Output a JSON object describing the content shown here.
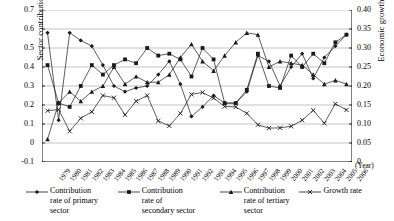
{
  "chart_data": {
    "type": "line",
    "title": "",
    "xlabel": "(Year)",
    "ylabel": "Sector contribution rate",
    "ylabel_right": "Economic growth rate",
    "ylim": [
      -0.1,
      0.7
    ],
    "ylim_right": [
      0,
      0.4
    ],
    "yticks": [
      "0.7",
      "0.6",
      "0.5",
      "0.4",
      "0.3",
      "0.2",
      "0.1",
      "0",
      "-0.1"
    ],
    "yticks_right": [
      "0.40",
      "0.35",
      "0.30",
      "0.25",
      "0.20",
      "0.15",
      "0.10",
      "0.05",
      "0"
    ],
    "grid": true,
    "legend_position": "bottom",
    "categories": [
      "1979",
      "1980",
      "1981",
      "1982",
      "1983",
      "1984",
      "1985",
      "1986",
      "1987",
      "1988",
      "1989",
      "1990",
      "1991",
      "1992",
      "1993",
      "1994",
      "1995",
      "1996",
      "1997",
      "1998",
      "1999",
      "2000",
      "2001",
      "2002",
      "2003",
      "2004",
      "2005",
      "2006"
    ],
    "series": [
      {
        "name": "Contribution rate of primary sector",
        "marker": "diamond",
        "axis": "left",
        "values": [
          0.58,
          0.12,
          0.58,
          0.54,
          0.51,
          0.41,
          0.3,
          0.27,
          0.29,
          0.3,
          0.36,
          0.43,
          0.31,
          0.14,
          0.19,
          0.25,
          0.21,
          0.21,
          0.27,
          0.46,
          0.43,
          0.3,
          0.4,
          0.47,
          0.34,
          0.45,
          0.51,
          0.57
        ]
      },
      {
        "name": "Contribution rate of secondary sector",
        "marker": "square",
        "axis": "left",
        "values": [
          0.41,
          0.21,
          0.19,
          0.3,
          0.41,
          0.36,
          0.41,
          0.44,
          0.42,
          0.5,
          0.46,
          0.47,
          0.44,
          0.35,
          0.5,
          0.44,
          0.21,
          0.21,
          0.28,
          0.47,
          0.3,
          0.29,
          0.46,
          0.4,
          0.47,
          0.42,
          0.53,
          0.57
        ]
      },
      {
        "name": "Contribution rate of tertiary sector",
        "marker": "triangle",
        "axis": "left",
        "values": [
          0.02,
          0.21,
          0.27,
          0.22,
          0.27,
          0.3,
          0.4,
          0.31,
          0.35,
          0.32,
          0.32,
          0.36,
          0.45,
          0.52,
          0.43,
          0.38,
          0.46,
          0.53,
          0.58,
          0.57,
          0.4,
          0.43,
          0.42,
          0.41,
          0.36,
          0.31,
          0.33,
          0.31
        ]
      },
      {
        "name": "Growth rate",
        "marker": "cross",
        "axis": "right",
        "values": [
          0.135,
          0.138,
          0.081,
          0.115,
          0.132,
          0.175,
          0.169,
          0.124,
          0.16,
          0.175,
          0.108,
          0.095,
          0.128,
          0.178,
          0.183,
          0.168,
          0.146,
          0.145,
          0.128,
          0.098,
          0.089,
          0.09,
          0.094,
          0.11,
          0.136,
          0.102,
          0.153,
          0.137
        ]
      }
    ]
  },
  "legend": [
    {
      "label_line1": "Contribution",
      "label_line2": "rate of primary",
      "label_line3": "sector",
      "marker": "diamond-marker"
    },
    {
      "label_line1": "Contribution",
      "label_line2": "rate of",
      "label_line3": "secondary sector",
      "marker": "square-marker"
    },
    {
      "label_line1": "Contribution",
      "label_line2": "rate of tertiary",
      "label_line3": "sector",
      "marker": "triangle-marker"
    },
    {
      "label_line1": "Growth rate",
      "label_line2": "",
      "label_line3": "",
      "marker": "cross-marker"
    }
  ],
  "colors": {
    "series": "#1a1a1a",
    "grid": "#9a9a9a",
    "axis": "#000000",
    "background": "#ffffff"
  }
}
